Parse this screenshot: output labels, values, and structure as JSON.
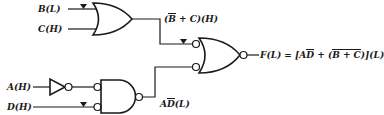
{
  "diagram": {
    "type": "logic-circuit",
    "inputs": [
      {
        "id": "B",
        "label": "B(L)",
        "signal": "B",
        "level": "L",
        "active_low_marker": true
      },
      {
        "id": "C",
        "label": "C(H)",
        "signal": "C",
        "level": "H",
        "active_low_marker": false
      },
      {
        "id": "A",
        "label": "A(H)",
        "signal": "A",
        "level": "H",
        "active_low_marker": false
      },
      {
        "id": "D",
        "label": "D(H)",
        "signal": "D",
        "level": "H",
        "active_low_marker": true
      }
    ],
    "gates": [
      {
        "id": "or1",
        "type": "OR",
        "inputs": [
          "B",
          "C"
        ],
        "output_label": "(B̄ + C)(H)"
      },
      {
        "id": "inv1",
        "type": "NOT",
        "inputs": [
          "A"
        ],
        "output_bubble": true
      },
      {
        "id": "nand1",
        "type": "NAND (bubbled inputs)",
        "inputs": [
          "inv1",
          "D"
        ],
        "output_label": "AD̄(L)"
      },
      {
        "id": "nor1",
        "type": "NOR (bubbled inputs)",
        "inputs": [
          "or1",
          "nand1"
        ],
        "output_label": "F(L)"
      }
    ],
    "labels": {
      "b_input": "B(L)",
      "c_input": "C(H)",
      "a_input": "A(H)",
      "d_input": "D(H)",
      "or_output": {
        "prefix": "(",
        "bbar": "B",
        "rest": " + C)(H)"
      },
      "nand_output": {
        "a": "A",
        "dbar": "D",
        "rest": "(L)"
      },
      "final_output": {
        "prefix": "F(L) = [A",
        "dbar": "D",
        "mid": " + (",
        "bbar": "B",
        "inner_rest": " + C",
        "close": ")",
        "suffix": "](L)"
      }
    },
    "colors": {
      "ink": "#1a1a1a",
      "background": "#ffffff"
    }
  }
}
